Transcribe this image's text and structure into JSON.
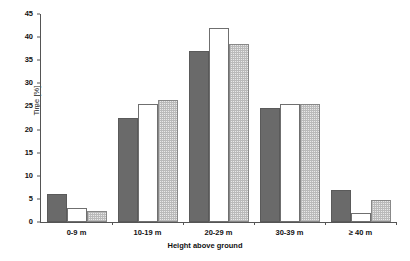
{
  "chart_data": {
    "type": "bar",
    "title": "",
    "xlabel": "Height above ground",
    "ylabel": "Time [%]",
    "ylim": [
      0,
      45
    ],
    "yticks": [
      0,
      5,
      10,
      15,
      20,
      25,
      30,
      35,
      40,
      45
    ],
    "grid": false,
    "legend": "none",
    "categories": [
      "0-9 m",
      "10-19 m",
      "20-29 m",
      "30-39 m",
      "≥ 40 m"
    ],
    "series": [
      {
        "name": "series-1-dark",
        "style": "solid-dark-gray",
        "color": "#6a6a6a",
        "values": [
          6.0,
          22.5,
          37.0,
          24.7,
          7.0
        ]
      },
      {
        "name": "series-2-white",
        "style": "white-outline",
        "color": "#ffffff",
        "values": [
          3.0,
          25.5,
          42.0,
          25.5,
          2.0
        ]
      },
      {
        "name": "series-3-hatch",
        "style": "light-stipple",
        "color": "#e8e8e8",
        "values": [
          2.3,
          26.5,
          38.5,
          25.5,
          4.7
        ]
      }
    ]
  },
  "axis": {
    "y_title": "Time [%]",
    "x_title": "Height above ground",
    "y_tick_labels": [
      "0",
      "5",
      "10",
      "15",
      "20",
      "25",
      "30",
      "35",
      "40",
      "45"
    ],
    "x_tick_labels": [
      "0-9 m",
      "10-19 m",
      "20-29 m",
      "30-39 m",
      "≥ 40 m"
    ]
  },
  "colors": {
    "series_dark": "#6a6a6a",
    "series_white": "#ffffff",
    "series_hatch": "#e8e8e8",
    "axis": "#555555",
    "text": "#111111",
    "background": "#ffffff"
  }
}
